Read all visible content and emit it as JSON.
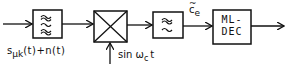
{
  "diagram": {
    "title": "",
    "blocks": [
      {
        "id": "bandpass-filter",
        "symbol": "bandpass-filter-icon",
        "glyph": "≈\n≈\n≈"
      },
      {
        "id": "mixer",
        "symbol": "multiplier-icon",
        "glyph": "×"
      },
      {
        "id": "lowpass-filter",
        "symbol": "lowpass-filter-icon",
        "glyph": "∼\n∼"
      },
      {
        "id": "ml-decoder",
        "line1": "ML-",
        "line2": "DEC"
      }
    ],
    "labels": {
      "input_signal_main": "s",
      "input_signal_sub": "μk",
      "input_signal_rest": "(t)+n(t)",
      "carrier": "sin ω",
      "carrier_sub": "c",
      "carrier_rest": "t",
      "filter_output": "c",
      "filter_output_sub": "e",
      "filter_output_accent": "~"
    },
    "colors": {
      "stroke": "#111111",
      "background": "#ffffff"
    }
  }
}
